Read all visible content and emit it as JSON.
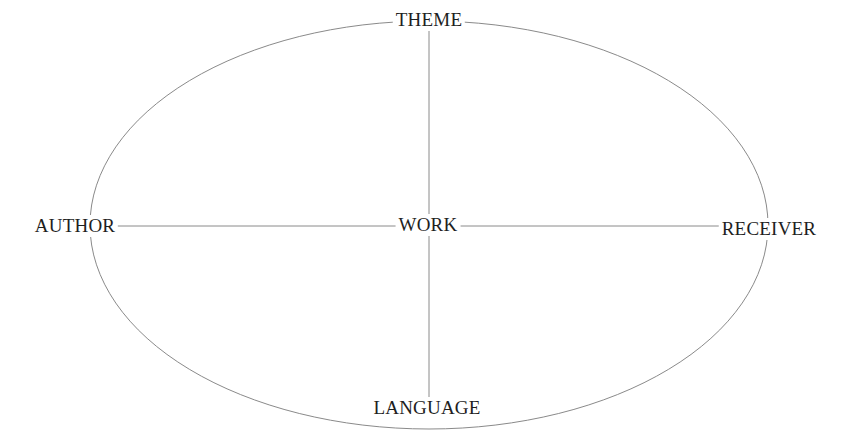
{
  "diagram": {
    "type": "ellipse-cross",
    "nodes": {
      "top": "THEME",
      "left": "AUTHOR",
      "center": "WORK",
      "right": "RECEIVER",
      "bottom": "LANGUAGE"
    },
    "edges": [
      [
        "WORK",
        "THEME"
      ],
      [
        "WORK",
        "AUTHOR"
      ],
      [
        "WORK",
        "RECEIVER"
      ],
      [
        "WORK",
        "LANGUAGE"
      ]
    ],
    "outline": "ellipse connecting THEME, RECEIVER, LANGUAGE, AUTHOR",
    "line_color": "#8a8a8a",
    "text_color": "#1e1e1e"
  }
}
